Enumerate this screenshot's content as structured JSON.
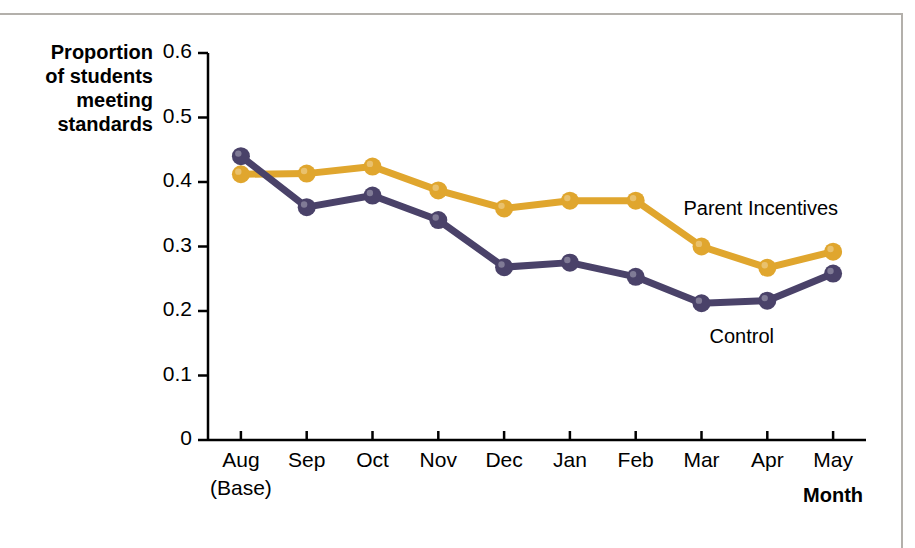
{
  "chart_data": {
    "type": "line",
    "title": "",
    "xlabel": "Month",
    "ylabel": "Proportion of students meeting standards",
    "ylabel_lines": [
      "Proportion",
      "of students",
      "meeting",
      "standards"
    ],
    "categories": [
      "Aug",
      "Sep",
      "Oct",
      "Nov",
      "Dec",
      "Jan",
      "Feb",
      "Mar",
      "Apr",
      "May"
    ],
    "category_sublabels": [
      "(Base)",
      "",
      "",
      "",
      "",
      "",
      "",
      "",
      "",
      ""
    ],
    "ylim": [
      0,
      0.6
    ],
    "yticks": [
      0,
      0.1,
      0.2,
      0.3,
      0.4,
      0.5,
      0.6
    ],
    "ytick_labels": [
      "0",
      "0.1",
      "0.2",
      "0.3",
      "0.4",
      "0.5",
      "0.6"
    ],
    "grid": false,
    "legend_position": "inline-right",
    "series": [
      {
        "name": "Parent Incentives",
        "color": "#e0a62e",
        "values": [
          0.412,
          0.413,
          0.424,
          0.387,
          0.359,
          0.371,
          0.371,
          0.3,
          0.267,
          0.292
        ]
      },
      {
        "name": "Control",
        "color": "#4a4269",
        "values": [
          0.44,
          0.361,
          0.379,
          0.341,
          0.268,
          0.275,
          0.253,
          0.212,
          0.216,
          0.258
        ]
      }
    ],
    "annotations": [
      {
        "text": "Parent Incentives",
        "series": "Parent Incentives"
      },
      {
        "text": "Control",
        "series": "Control"
      }
    ]
  },
  "colors": {
    "parent_incentives": "#e0a62e",
    "control": "#4a4269",
    "axis": "#000000",
    "frame": "#b3b0ab",
    "background": "#ffffff"
  }
}
